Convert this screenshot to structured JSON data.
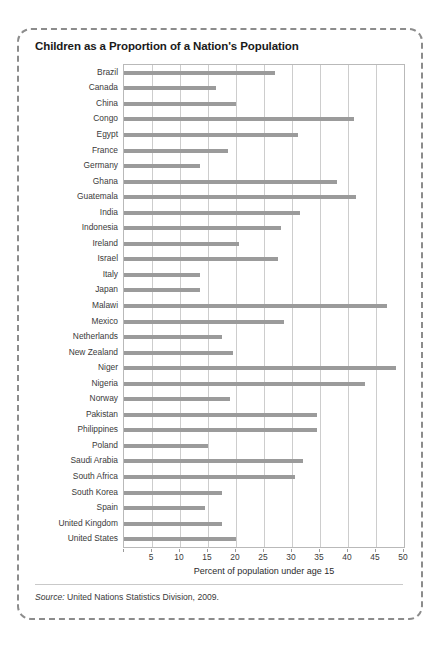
{
  "figure": {
    "title": "Children as a Proportion of a Nation's Population",
    "source_label": "Source:",
    "source_text": " United Nations Statistics Division, 2009."
  },
  "chart_data": {
    "type": "bar",
    "orientation": "horizontal",
    "title": "Children as a Proportion of a Nation's Population",
    "xlabel": "Percent of population under age 15",
    "ylabel": "",
    "xlim": [
      0,
      50
    ],
    "xticks": [
      0,
      5,
      10,
      15,
      20,
      25,
      30,
      35,
      40,
      45,
      50
    ],
    "xtick_labels": [
      "",
      "5",
      "10",
      "15",
      "20",
      "25",
      "30",
      "35",
      "40",
      "45",
      "50"
    ],
    "grid": "vertical",
    "legend": "none",
    "bar_color": "#9b9b9b",
    "categories": [
      "Brazil",
      "Canada",
      "China",
      "Congo",
      "Egypt",
      "France",
      "Germany",
      "Ghana",
      "Guatemala",
      "India",
      "Indonesia",
      "Ireland",
      "Israel",
      "Italy",
      "Japan",
      "Malawi",
      "Mexico",
      "Netherlands",
      "New Zealand",
      "Niger",
      "Nigeria",
      "Norway",
      "Pakistan",
      "Philippines",
      "Poland",
      "Saudi Arabia",
      "South Africa",
      "South Korea",
      "Spain",
      "United Kingdom",
      "United States"
    ],
    "values": [
      27.0,
      16.5,
      20.0,
      41.0,
      31.0,
      18.5,
      13.5,
      38.0,
      41.5,
      31.5,
      28.0,
      20.5,
      27.5,
      13.5,
      13.5,
      47.0,
      28.5,
      17.5,
      19.5,
      48.5,
      43.0,
      19.0,
      34.5,
      34.5,
      15.0,
      32.0,
      30.5,
      17.5,
      14.5,
      17.5,
      20.0
    ]
  }
}
